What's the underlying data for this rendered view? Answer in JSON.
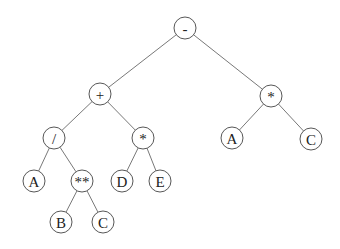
{
  "diagram": {
    "type": "expression-tree",
    "node_radius": 11,
    "colors": {
      "background": "#ffffff",
      "stroke": "#444444",
      "text": "#222222"
    },
    "nodes": [
      {
        "id": "root",
        "label": "-",
        "x": 185,
        "y": 28
      },
      {
        "id": "plus",
        "label": "+",
        "x": 100,
        "y": 94
      },
      {
        "id": "mulR",
        "label": "*",
        "x": 271,
        "y": 96
      },
      {
        "id": "div",
        "label": "/",
        "x": 54,
        "y": 138
      },
      {
        "id": "mulL",
        "label": "*",
        "x": 143,
        "y": 138
      },
      {
        "id": "aR",
        "label": "A",
        "x": 232,
        "y": 138
      },
      {
        "id": "cR",
        "label": "C",
        "x": 311,
        "y": 139
      },
      {
        "id": "aL",
        "label": "A",
        "x": 34,
        "y": 181
      },
      {
        "id": "pow",
        "label": "**",
        "x": 82,
        "y": 181
      },
      {
        "id": "d",
        "label": "D",
        "x": 122,
        "y": 181
      },
      {
        "id": "e",
        "label": "E",
        "x": 160,
        "y": 181
      },
      {
        "id": "b",
        "label": "B",
        "x": 61,
        "y": 222
      },
      {
        "id": "cL",
        "label": "C",
        "x": 103,
        "y": 222
      }
    ],
    "edges": [
      [
        "root",
        "plus"
      ],
      [
        "root",
        "mulR"
      ],
      [
        "plus",
        "div"
      ],
      [
        "plus",
        "mulL"
      ],
      [
        "mulR",
        "aR"
      ],
      [
        "mulR",
        "cR"
      ],
      [
        "div",
        "aL"
      ],
      [
        "div",
        "pow"
      ],
      [
        "mulL",
        "d"
      ],
      [
        "mulL",
        "e"
      ],
      [
        "pow",
        "b"
      ],
      [
        "pow",
        "cL"
      ]
    ]
  }
}
